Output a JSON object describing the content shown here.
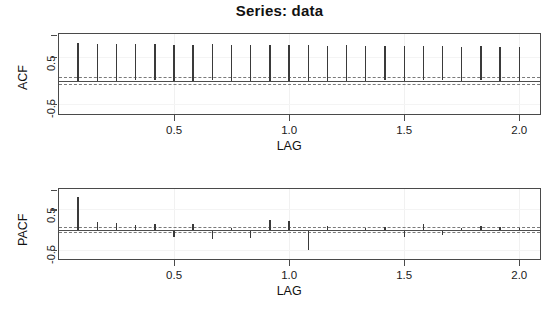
{
  "figure": {
    "title": "Series:  data",
    "background": "#ffffff",
    "spike_color": "#3a3a3a",
    "axis_color": "#4a4a4a",
    "ci_color": "#7a7a7a"
  },
  "chart_data": [
    {
      "type": "bar",
      "name": "acf-panel",
      "title": "Series:  data",
      "xlabel": "LAG",
      "ylabel": "ACF",
      "xlim": [
        0.0,
        2.09
      ],
      "ylim": [
        -0.72,
        1.0
      ],
      "xticks": [
        0.5,
        1.0,
        1.5,
        2.0
      ],
      "xticklabels": [
        "0.5",
        "1.0",
        "1.5",
        "2.0"
      ],
      "yticks": [
        0.5,
        -0.5
      ],
      "yticklabels": [
        "0.5",
        "-0.5"
      ],
      "grid": false,
      "zero_line": 0.0,
      "confidence_bands": [
        0.065,
        -0.065
      ],
      "x": [
        0.083,
        0.167,
        0.25,
        0.333,
        0.417,
        0.5,
        0.583,
        0.667,
        0.75,
        0.833,
        0.917,
        1.0,
        1.083,
        1.167,
        1.25,
        1.333,
        1.417,
        1.5,
        1.583,
        1.667,
        1.75,
        1.833,
        1.917,
        2.0
      ],
      "values": [
        0.8,
        0.79,
        0.79,
        0.78,
        0.78,
        0.77,
        0.77,
        0.78,
        0.76,
        0.77,
        0.76,
        0.76,
        0.77,
        0.75,
        0.76,
        0.75,
        0.74,
        0.75,
        0.74,
        0.74,
        0.73,
        0.74,
        0.73,
        0.73
      ]
    },
    {
      "type": "bar",
      "name": "pacf-panel",
      "title": "",
      "xlabel": "LAG",
      "ylabel": "PACF",
      "xlim": [
        0.0,
        2.09
      ],
      "ylim": [
        -0.72,
        1.0
      ],
      "xticks": [
        0.5,
        1.0,
        1.5,
        2.0
      ],
      "xticklabels": [
        "0.5",
        "1.0",
        "1.5",
        "2.0"
      ],
      "yticks": [
        0.5,
        -0.5
      ],
      "yticklabels": [
        "0.5",
        "-0.5"
      ],
      "grid": false,
      "zero_line": 0.0,
      "confidence_bands": [
        0.065,
        -0.065
      ],
      "x": [
        0.083,
        0.167,
        0.25,
        0.333,
        0.417,
        0.5,
        0.583,
        0.667,
        0.75,
        0.833,
        0.917,
        1.0,
        1.083,
        1.167,
        1.25,
        1.333,
        1.417,
        1.5,
        1.583,
        1.667,
        1.75,
        1.833,
        1.917,
        2.0
      ],
      "values": [
        0.8,
        0.2,
        0.16,
        0.12,
        0.14,
        -0.17,
        0.13,
        -0.22,
        0.04,
        -0.2,
        0.25,
        0.22,
        -0.5,
        0.08,
        -0.04,
        0.03,
        0.06,
        -0.18,
        0.14,
        -0.13,
        0.03,
        0.1,
        0.07,
        0.04
      ]
    }
  ],
  "acf": {
    "ylabel": "ACF",
    "xlabel": "LAG",
    "yticklabels": [
      "0.5",
      "-0.5"
    ],
    "xticklabels": [
      "0.5",
      "1.0",
      "1.5",
      "2.0"
    ]
  },
  "pacf": {
    "ylabel": "PACF",
    "xlabel": "LAG",
    "yticklabels": [
      "0.5",
      "-0.5"
    ],
    "xticklabels": [
      "0.5",
      "1.0",
      "1.5",
      "2.0"
    ]
  }
}
